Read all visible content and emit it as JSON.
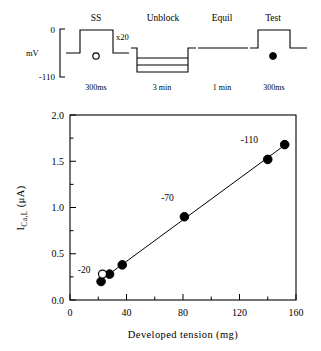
{
  "protocol": {
    "axis": {
      "unit_label": "mV",
      "top_label": "0",
      "bottom_label": "-110"
    },
    "repeat_annotation": "x20",
    "phases": [
      {
        "name": "SS",
        "title": "SS",
        "duration": "300ms",
        "marker": "open-circle"
      },
      {
        "name": "Unblock",
        "title": "Unblock",
        "duration": "3 min",
        "marker": "none"
      },
      {
        "name": "Equil",
        "title": "Equil",
        "duration": "1 min",
        "marker": "none"
      },
      {
        "name": "Test",
        "title": "Test",
        "duration": "300ms",
        "marker": "filled-circle"
      }
    ]
  },
  "chart_data": {
    "type": "scatter",
    "title": "",
    "xlabel": "Developed tension (mg)",
    "ylabel": "I_Ca,L (μA)",
    "ylabel_parts": {
      "main": "I",
      "sub": "Ca,L",
      "unit": "(μA)"
    },
    "xlim": [
      0,
      160
    ],
    "ylim": [
      0.0,
      2.0
    ],
    "xticks": [
      0,
      40,
      80,
      120,
      160
    ],
    "xticklabels": [
      "0",
      "40",
      "80",
      "120",
      "160"
    ],
    "xminorticks": [
      20,
      60,
      100,
      140
    ],
    "yticks": [
      0.0,
      0.5,
      1.0,
      1.5,
      2.0
    ],
    "yticklabels": [
      "0.0",
      "0.5",
      "1.0",
      "1.5",
      "2.0"
    ],
    "yminorticks": [
      0.25,
      0.75,
      1.25,
      1.75
    ],
    "grid": false,
    "legend": false,
    "series": [
      {
        "name": "Test pulse (filled)",
        "marker": "filled-circle",
        "color": "#000000",
        "points": [
          {
            "x": 22,
            "y": 0.2,
            "label": ""
          },
          {
            "x": 28,
            "y": 0.28,
            "label": ""
          },
          {
            "x": 37,
            "y": 0.38,
            "label": ""
          },
          {
            "x": 81,
            "y": 0.9,
            "label": "-70"
          },
          {
            "x": 140,
            "y": 1.52,
            "label": "-110"
          },
          {
            "x": 152,
            "y": 1.68,
            "label": ""
          }
        ]
      },
      {
        "name": "Steady state (open)",
        "marker": "open-circle",
        "color": "#ffffff",
        "points": [
          {
            "x": 23,
            "y": 0.28,
            "label": "-20"
          }
        ]
      }
    ],
    "fit_line": {
      "x": [
        21,
        153
      ],
      "y": [
        0.205,
        1.685
      ]
    },
    "annotations": [
      {
        "text": "-20",
        "x": 10,
        "y": 0.295,
        "anchor": "middle"
      },
      {
        "text": "-70",
        "x": 69,
        "y": 1.07,
        "anchor": "middle"
      },
      {
        "text": "-110",
        "x": 127,
        "y": 1.7,
        "anchor": "middle"
      }
    ]
  }
}
